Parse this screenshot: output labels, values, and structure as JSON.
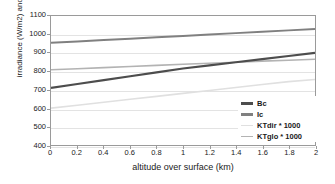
{
  "chart_data": {
    "type": "line",
    "title": "",
    "xlabel": "altitude over surface (km)",
    "ylabel": "irradiance (W/m2) and KT*1000",
    "xlim": [
      0,
      2
    ],
    "ylim": [
      400,
      1100
    ],
    "x_ticks": [
      "0",
      "0.2",
      "0.4",
      "0.6",
      "0.8",
      "1",
      "1.2",
      "1.4",
      "1.6",
      "1.8",
      "2"
    ],
    "y_ticks": [
      "1100",
      "1000",
      "900",
      "800",
      "700",
      "600",
      "500",
      "400"
    ],
    "grid": true,
    "legend_position": "bottom-right",
    "x": [
      0,
      0.2,
      0.4,
      0.6,
      0.8,
      1.0,
      1.2,
      1.4,
      1.6,
      1.8,
      2.0
    ],
    "series": [
      {
        "name": "Bc",
        "color": "#4d4d4d",
        "width": 2.2,
        "values": [
          710,
          731,
          752,
          773,
          794,
          815,
          832,
          849,
          866,
          883,
          900
        ]
      },
      {
        "name": "Ic",
        "color": "#808080",
        "width": 2.0,
        "values": [
          955,
          962,
          970,
          977,
          985,
          992,
          1000,
          1007,
          1015,
          1022,
          1030
        ]
      },
      {
        "name": "KTdir * 1000",
        "color": "#e0e0e0",
        "width": 1.6,
        "values": [
          600,
          616,
          632,
          648,
          664,
          680,
          696,
          712,
          728,
          744,
          755
        ]
      },
      {
        "name": "KTglo * 1000",
        "color": "#b3b3b3",
        "width": 1.6,
        "values": [
          808,
          814,
          820,
          826,
          832,
          838,
          844,
          849,
          855,
          860,
          865
        ]
      }
    ]
  },
  "legend": {
    "items": [
      {
        "label": "Bc"
      },
      {
        "label": "Ic"
      },
      {
        "label": "KTdir * 1000"
      },
      {
        "label": "KTglo * 1000"
      }
    ]
  }
}
